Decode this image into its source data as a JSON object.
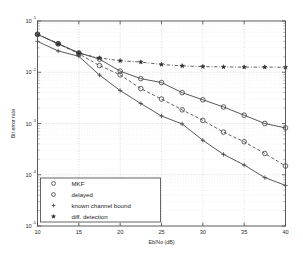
{
  "chart_data": {
    "type": "line",
    "title": "",
    "xlabel": "Eb/No (dB)",
    "ylabel": "Bit error rate",
    "xlim": [
      10,
      40
    ],
    "ylim": [
      1e-05,
      0.1
    ],
    "yscale": "log",
    "xticks": [
      10,
      15,
      20,
      25,
      30,
      35,
      40
    ],
    "xticklabels": [
      "10",
      "15",
      "20",
      "25",
      "30",
      "35",
      "40"
    ],
    "yticks": [
      0.1,
      0.01,
      0.001,
      0.0001,
      1e-05
    ],
    "yticklabels": [
      "10",
      "10",
      "10",
      "10",
      "10"
    ],
    "ytickexponents": [
      "-1",
      "-2",
      "-3",
      "-4",
      "-5"
    ],
    "grid": true,
    "legend_position": "lower left",
    "series": [
      {
        "name": "MKF",
        "marker": "circle",
        "linestyle": "solid",
        "x": [
          10,
          12.5,
          15,
          17.5,
          20,
          22.5,
          25,
          27.5,
          30,
          32.5,
          35,
          37.5,
          40
        ],
        "y": [
          0.055,
          0.036,
          0.024,
          0.018,
          0.0105,
          0.0075,
          0.0063,
          0.004,
          0.0029,
          0.0021,
          0.00145,
          0.001,
          0.00082
        ]
      },
      {
        "name": "delayed",
        "marker": "circle",
        "linestyle": "dashed",
        "x": [
          10,
          12.5,
          15,
          17.5,
          20,
          22.5,
          25,
          27.5,
          30,
          32.5,
          35,
          37.5,
          40
        ],
        "y": [
          0.055,
          0.036,
          0.023,
          0.0135,
          0.0089,
          0.0048,
          0.003,
          0.00185,
          0.00115,
          0.00068,
          0.00044,
          0.00026,
          0.000148
        ]
      },
      {
        "name": "known channel bound",
        "marker": "plus",
        "linestyle": "solid",
        "x": [
          10,
          12.5,
          15,
          17.5,
          20,
          22.5,
          25,
          27.5,
          30,
          32.5,
          35,
          37.5,
          40
        ],
        "y": [
          0.04,
          0.026,
          0.0205,
          0.0088,
          0.0044,
          0.00245,
          0.0014,
          0.00098,
          0.00047,
          0.00025,
          0.000155,
          8.8e-05,
          6.2e-05
        ]
      },
      {
        "name": "diff. detection",
        "marker": "star",
        "linestyle": "dashdot",
        "x": [
          10,
          12.5,
          15,
          17.5,
          20,
          22.5,
          25,
          27.5,
          30,
          32.5,
          35,
          37.5,
          40
        ],
        "y": [
          0.055,
          0.036,
          0.0235,
          0.019,
          0.0168,
          0.0158,
          0.0142,
          0.0133,
          0.0129,
          0.0127,
          0.0126,
          0.0126,
          0.0125
        ]
      }
    ]
  },
  "legend": {
    "entries": [
      {
        "label": "MKF"
      },
      {
        "label": "delayed"
      },
      {
        "label": "known channel bound"
      },
      {
        "label": "diff. detection"
      }
    ]
  },
  "colors": {
    "axis": "#4a4a4a",
    "curve": "#3b3b3b",
    "grid": "#b9b9b9",
    "background": "#ffffff"
  }
}
